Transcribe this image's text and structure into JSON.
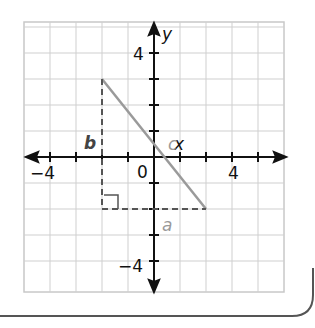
{
  "graph": {
    "axis_labels": {
      "x": "x",
      "y": "y"
    },
    "tick_labels": {
      "x_neg": "−4",
      "x_pos": "4",
      "y_pos": "4",
      "y_neg": "−4",
      "origin": "0"
    },
    "grid": {
      "x_range": [
        -5,
        5
      ],
      "y_range": [
        -5,
        5
      ],
      "step": 1
    },
    "segments": {
      "hypotenuse": {
        "label": "c",
        "from": [
          -2,
          3
        ],
        "to": [
          2,
          -2
        ],
        "color": "#9a9a9a"
      },
      "leg_vertical": {
        "label": "b",
        "from": [
          -2,
          3
        ],
        "to": [
          -2,
          -2
        ],
        "style": "dashed"
      },
      "leg_horizontal": {
        "label": "a",
        "from": [
          -2,
          -2
        ],
        "to": [
          2,
          -2
        ],
        "style": "dashed"
      }
    },
    "right_angle_at": [
      -2,
      -2
    ]
  }
}
